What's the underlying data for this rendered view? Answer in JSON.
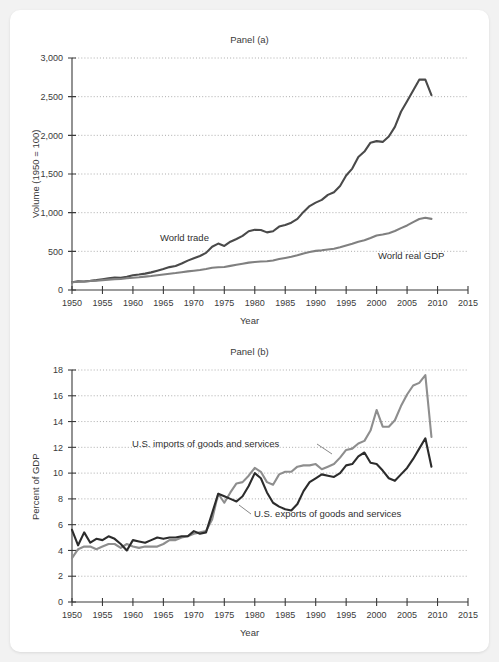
{
  "figure": {
    "background_color": "#f2f2f2",
    "card_color": "#ffffff"
  },
  "panel_a": {
    "title": "Panel (a)",
    "xlabel": "Year",
    "ylabel": "Volume (1950 = 100)",
    "annotation_trade": "World trade",
    "annotation_gdp": "World real GDP"
  },
  "panel_b": {
    "title": "Panel (b)",
    "xlabel": "Year",
    "ylabel": "Percent of GDP",
    "annotation_imports": "U.S. imports of goods and services",
    "annotation_exports": "U.S. exports of goods and services"
  },
  "chart_data": [
    {
      "type": "line",
      "title": "Panel (a)",
      "xlabel": "Year",
      "ylabel": "Volume (1950 = 100)",
      "xlim": [
        1950,
        2015
      ],
      "ylim": [
        0,
        3000
      ],
      "xticks": [
        1950,
        1955,
        1960,
        1965,
        1970,
        1975,
        1980,
        1985,
        1990,
        1995,
        2000,
        2005,
        2010,
        2015
      ],
      "xticklabels": [
        "1950",
        "1955",
        "1960",
        "1965",
        "1970",
        "1975",
        "1980",
        "1985",
        "1990",
        "1995",
        "2000",
        "2005",
        "2010",
        "2015"
      ],
      "yticks": [
        0,
        500,
        1000,
        1500,
        2000,
        2500,
        3000
      ],
      "yticklabels": [
        "0",
        "500",
        "1,000",
        "1,500",
        "2,000",
        "2,500",
        "3,000"
      ],
      "grid": true,
      "legend": "annotations-on-plot",
      "series": [
        {
          "name": "World trade",
          "color": "#4a4a4a",
          "x": [
            1950,
            1951,
            1952,
            1953,
            1954,
            1955,
            1956,
            1957,
            1958,
            1959,
            1960,
            1961,
            1962,
            1963,
            1964,
            1965,
            1966,
            1967,
            1968,
            1969,
            1970,
            1971,
            1972,
            1973,
            1974,
            1975,
            1976,
            1977,
            1978,
            1979,
            1980,
            1981,
            1982,
            1983,
            1984,
            1985,
            1986,
            1987,
            1988,
            1989,
            1990,
            1991,
            1992,
            1993,
            1994,
            1995,
            1996,
            1997,
            1998,
            1999,
            2000,
            2001,
            2002,
            2003,
            2004,
            2005,
            2006,
            2007,
            2008,
            2009
          ],
          "values": [
            100,
            112,
            110,
            118,
            128,
            140,
            152,
            160,
            158,
            172,
            190,
            200,
            212,
            228,
            250,
            272,
            296,
            310,
            342,
            380,
            410,
            440,
            480,
            560,
            600,
            570,
            625,
            660,
            700,
            760,
            780,
            775,
            745,
            760,
            820,
            840,
            870,
            920,
            1010,
            1085,
            1130,
            1165,
            1230,
            1265,
            1345,
            1480,
            1570,
            1720,
            1790,
            1905,
            1925,
            1915,
            1985,
            2110,
            2305,
            2440,
            2580,
            2720,
            2720,
            2520
          ]
        },
        {
          "name": "World real GDP",
          "color": "#808080",
          "x": [
            1950,
            1951,
            1952,
            1953,
            1954,
            1955,
            1956,
            1957,
            1958,
            1959,
            1960,
            1961,
            1962,
            1963,
            1964,
            1965,
            1966,
            1967,
            1968,
            1969,
            1970,
            1971,
            1972,
            1973,
            1974,
            1975,
            1976,
            1977,
            1978,
            1979,
            1980,
            1981,
            1982,
            1983,
            1984,
            1985,
            1986,
            1987,
            1988,
            1989,
            1990,
            1991,
            1992,
            1993,
            1994,
            1995,
            1996,
            1997,
            1998,
            1999,
            2000,
            2001,
            2002,
            2003,
            2004,
            2005,
            2006,
            2007,
            2008,
            2009
          ],
          "values": [
            100,
            106,
            110,
            116,
            120,
            128,
            134,
            140,
            143,
            151,
            159,
            165,
            173,
            181,
            191,
            201,
            211,
            219,
            230,
            241,
            250,
            259,
            272,
            288,
            294,
            297,
            312,
            326,
            340,
            354,
            362,
            368,
            371,
            382,
            400,
            415,
            430,
            448,
            472,
            492,
            506,
            513,
            524,
            534,
            554,
            576,
            598,
            624,
            644,
            672,
            705,
            718,
            735,
            762,
            800,
            835,
            878,
            918,
            935,
            920
          ]
        }
      ]
    },
    {
      "type": "line",
      "title": "Panel (b)",
      "xlabel": "Year",
      "ylabel": "Percent of GDP",
      "xlim": [
        1950,
        2015
      ],
      "ylim": [
        0,
        18
      ],
      "xticks": [
        1950,
        1955,
        1960,
        1965,
        1970,
        1975,
        1980,
        1985,
        1990,
        1995,
        2000,
        2005,
        2010,
        2015
      ],
      "xticklabels": [
        "1950",
        "1955",
        "1960",
        "1965",
        "1970",
        "1975",
        "1980",
        "1985",
        "1990",
        "1995",
        "2000",
        "2005",
        "2010",
        "2015"
      ],
      "yticks": [
        0,
        2,
        4,
        6,
        8,
        10,
        12,
        14,
        16,
        18
      ],
      "yticklabels": [
        "0",
        "2",
        "4",
        "6",
        "8",
        "10",
        "12",
        "14",
        "16",
        "18"
      ],
      "grid": true,
      "legend": "annotations-on-plot",
      "series": [
        {
          "name": "U.S. imports of goods and services",
          "color": "#8e8e8e",
          "x": [
            1950,
            1951,
            1952,
            1953,
            1954,
            1955,
            1956,
            1957,
            1958,
            1959,
            1960,
            1961,
            1962,
            1963,
            1964,
            1965,
            1966,
            1967,
            1968,
            1969,
            1970,
            1971,
            1972,
            1973,
            1974,
            1975,
            1976,
            1977,
            1978,
            1979,
            1980,
            1981,
            1982,
            1983,
            1984,
            1985,
            1986,
            1987,
            1988,
            1989,
            1990,
            1991,
            1992,
            1993,
            1994,
            1995,
            1996,
            1997,
            1998,
            1999,
            2000,
            2001,
            2002,
            2003,
            2004,
            2005,
            2006,
            2007,
            2008,
            2009
          ],
          "values": [
            3.4,
            4.1,
            4.3,
            4.3,
            4.1,
            4.3,
            4.5,
            4.5,
            4.2,
            4.5,
            4.3,
            4.2,
            4.3,
            4.3,
            4.3,
            4.5,
            4.8,
            4.8,
            5.0,
            5.1,
            5.3,
            5.4,
            5.5,
            6.4,
            8.4,
            7.7,
            8.5,
            9.2,
            9.3,
            9.8,
            10.4,
            10.1,
            9.3,
            9.1,
            9.9,
            10.1,
            10.1,
            10.5,
            10.6,
            10.6,
            10.7,
            10.3,
            10.5,
            10.7,
            11.2,
            11.8,
            11.9,
            12.3,
            12.5,
            13.3,
            14.9,
            13.6,
            13.6,
            14.1,
            15.2,
            16.1,
            16.8,
            17.0,
            17.6,
            12.8
          ]
        },
        {
          "name": "U.S. exports of goods and services",
          "color": "#2c2c2c",
          "x": [
            1950,
            1951,
            1952,
            1953,
            1954,
            1955,
            1956,
            1957,
            1958,
            1959,
            1960,
            1961,
            1962,
            1963,
            1964,
            1965,
            1966,
            1967,
            1968,
            1969,
            1970,
            1971,
            1972,
            1973,
            1974,
            1975,
            1976,
            1977,
            1978,
            1979,
            1980,
            1981,
            1982,
            1983,
            1984,
            1985,
            1986,
            1987,
            1988,
            1989,
            1990,
            1991,
            1992,
            1993,
            1994,
            1995,
            1996,
            1997,
            1998,
            1999,
            2000,
            2001,
            2002,
            2003,
            2004,
            2005,
            2006,
            2007,
            2008,
            2009
          ],
          "values": [
            5.6,
            4.4,
            5.4,
            4.6,
            4.9,
            4.8,
            5.1,
            4.9,
            4.5,
            4.0,
            4.8,
            4.7,
            4.6,
            4.8,
            5.0,
            4.9,
            5.0,
            5.0,
            5.1,
            5.1,
            5.5,
            5.3,
            5.4,
            6.9,
            8.4,
            8.2,
            8.0,
            7.8,
            8.2,
            9.0,
            10.0,
            9.6,
            8.5,
            7.7,
            7.4,
            7.2,
            7.1,
            7.6,
            8.6,
            9.3,
            9.6,
            9.9,
            9.8,
            9.7,
            10.0,
            10.6,
            10.7,
            11.3,
            11.6,
            10.8,
            10.7,
            10.2,
            9.6,
            9.4,
            9.9,
            10.4,
            11.1,
            11.9,
            12.7,
            10.5
          ]
        }
      ]
    }
  ]
}
